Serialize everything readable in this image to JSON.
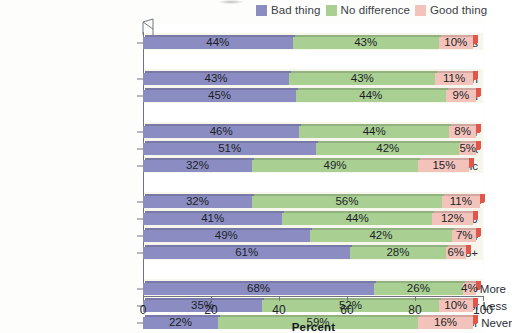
{
  "legend": {
    "items": [
      {
        "label": "Bad thing",
        "color": "#8b8dc2",
        "name": "legend-bad-thing"
      },
      {
        "label": "No difference",
        "color": "#a9cf93",
        "name": "legend-no-difference"
      },
      {
        "label": "Good thing",
        "color": "#f3c3bb",
        "name": "legend-good-thing"
      }
    ]
  },
  "axis": {
    "x_title": "Percent",
    "x_ticks": [
      "0",
      "20",
      "40",
      "60",
      "80",
      "100"
    ]
  },
  "chart_data": {
    "type": "bar",
    "orientation": "horizontal",
    "stacked": true,
    "title": "",
    "xlabel": "Percent",
    "ylabel": "",
    "xlim": [
      0,
      100
    ],
    "grid": false,
    "legend_position": "top-right",
    "series": [
      {
        "name": "Bad thing",
        "color": "#8b8dc2",
        "values": [
          44,
          43,
          45,
          46,
          51,
          32,
          32,
          41,
          49,
          61,
          68,
          35,
          22
        ]
      },
      {
        "name": "No difference",
        "color": "#a9cf93",
        "values": [
          43,
          43,
          44,
          44,
          42,
          49,
          56,
          44,
          42,
          28,
          26,
          52,
          59
        ]
      },
      {
        "name": "Good thing",
        "color": "#f3c3bb",
        "values": [
          10,
          11,
          9,
          8,
          5,
          15,
          11,
          12,
          7,
          6,
          4,
          10,
          16
        ]
      }
    ],
    "categories": [
      "All Adults",
      "Men",
      "Women",
      "White",
      "Black",
      "Hispanic",
      "18–29",
      "30–49",
      "50–64",
      "65+",
      "Attend Church Weekly or More",
      "Attend Church Monthly or Less",
      "Attend Church Seldom or Never"
    ],
    "groups": [
      {
        "name": "overall",
        "categories": [
          "All Adults"
        ]
      },
      {
        "name": "gender",
        "categories": [
          "Men",
          "Women"
        ]
      },
      {
        "name": "race",
        "categories": [
          "White",
          "Black",
          "Hispanic"
        ]
      },
      {
        "name": "age",
        "categories": [
          "18–29",
          "30–49",
          "50–64",
          "65+"
        ]
      },
      {
        "name": "religion",
        "categories": [
          "Attend Church Weekly or More",
          "Attend Church Monthly or Less",
          "Attend Church Seldom or Never"
        ]
      }
    ]
  },
  "rows": [
    {
      "label": "All Adults",
      "bad": 44,
      "nodiff": 43,
      "good": 10,
      "bad_label": "44%",
      "nodiff_label": "43%",
      "good_label": "10%",
      "top": 17
    },
    {
      "label": "Men",
      "bad": 43,
      "nodiff": 43,
      "good": 11,
      "bad_label": "43%",
      "nodiff_label": "43%",
      "good_label": "11%",
      "top": 53
    },
    {
      "label": "Women",
      "bad": 45,
      "nodiff": 44,
      "good": 9,
      "bad_label": "45%",
      "nodiff_label": "44%",
      "good_label": "9%",
      "top": 70
    },
    {
      "label": "White",
      "bad": 46,
      "nodiff": 44,
      "good": 8,
      "bad_label": "46%",
      "nodiff_label": "44%",
      "good_label": "8%",
      "top": 106
    },
    {
      "label": "Black",
      "bad": 51,
      "nodiff": 42,
      "good": 5,
      "bad_label": "51%",
      "nodiff_label": "42%",
      "good_label": "5%",
      "top": 123
    },
    {
      "label": "Hispanic",
      "bad": 32,
      "nodiff": 49,
      "good": 15,
      "bad_label": "32%",
      "nodiff_label": "49%",
      "good_label": "15%",
      "top": 140
    },
    {
      "label": "18–29",
      "bad": 32,
      "nodiff": 56,
      "good": 11,
      "bad_label": "32%",
      "nodiff_label": "56%",
      "good_label": "11%",
      "top": 176
    },
    {
      "label": "30–49",
      "bad": 41,
      "nodiff": 44,
      "good": 12,
      "bad_label": "41%",
      "nodiff_label": "44%",
      "good_label": "12%",
      "top": 193
    },
    {
      "label": "50–64",
      "bad": 49,
      "nodiff": 42,
      "good": 7,
      "bad_label": "49%",
      "nodiff_label": "42%",
      "good_label": "7%",
      "top": 210
    },
    {
      "label": "65+",
      "bad": 61,
      "nodiff": 28,
      "good": 6,
      "bad_label": "61%",
      "nodiff_label": "28%",
      "good_label": "6%",
      "top": 227
    },
    {
      "label": "Attend Church Weekly or More",
      "bad": 68,
      "nodiff": 26,
      "good": 4,
      "bad_label": "68%",
      "nodiff_label": "26%",
      "good_label": "4%",
      "top": 263
    },
    {
      "label": "Attend Church Monthly or Less",
      "bad": 35,
      "nodiff": 52,
      "good": 10,
      "bad_label": "35%",
      "nodiff_label": "52%",
      "good_label": "10%",
      "top": 280
    },
    {
      "label": "Attend Church Seldom or Never",
      "bad": 22,
      "nodiff": 59,
      "good": 16,
      "bad_label": "22%",
      "nodiff_label": "59%",
      "good_label": "16%",
      "top": 297
    }
  ]
}
